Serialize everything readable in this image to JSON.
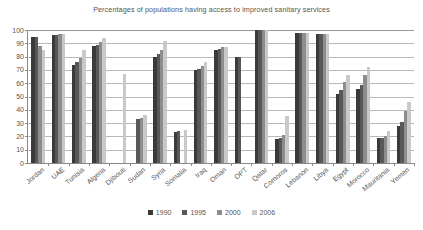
{
  "chart_data": {
    "type": "bar",
    "title": "Percentages of populations having access to improved sanitary services",
    "xlabel": "",
    "ylabel": "",
    "ylim": [
      0,
      100
    ],
    "yticks": [
      0,
      10,
      20,
      30,
      40,
      50,
      60,
      70,
      80,
      90,
      100
    ],
    "grid": true,
    "legend_position": "bottom",
    "categories": [
      "Jordan",
      "UAE",
      "Tunisia",
      "Algeria",
      "Djibouti",
      "Sudan",
      "Syria",
      "Somalia",
      "Iraq",
      "Oman",
      "OPT",
      "Qatar",
      "Comoros",
      "Lebanon",
      "Libya",
      "Egypt",
      "Morocco",
      "Mauritania",
      "Yemen"
    ],
    "series": [
      {
        "name": "1990",
        "color": "#3a3a3a",
        "values": [
          95,
          96,
          74,
          88,
          null,
          null,
          80,
          23,
          70,
          85,
          80,
          100,
          18,
          98,
          97,
          52,
          56,
          19,
          28
        ]
      },
      {
        "name": "1995",
        "color": "#585858",
        "values": [
          95,
          96,
          76,
          89,
          null,
          33,
          82,
          24,
          71,
          86,
          80,
          100,
          19,
          98,
          97,
          55,
          59,
          19,
          31
        ]
      },
      {
        "name": "2000",
        "color": "#8d8d8d",
        "values": [
          88,
          97,
          79,
          91,
          null,
          34,
          85,
          null,
          73,
          87,
          null,
          100,
          21,
          98,
          97,
          61,
          66,
          20,
          39
        ]
      },
      {
        "name": "2006",
        "color": "#c9c9c9",
        "values": [
          85,
          97,
          85,
          94,
          67,
          36,
          92,
          25,
          76,
          87,
          null,
          100,
          35,
          98,
          97,
          66,
          72,
          24,
          46
        ]
      }
    ]
  },
  "legend": {
    "items": [
      {
        "label": "1990",
        "color": "#3a3a3a"
      },
      {
        "label": "1995",
        "color": "#585858"
      },
      {
        "label": "2000",
        "color": "#8d8d8d"
      },
      {
        "label": "2006",
        "color": "#c9c9c9"
      }
    ]
  }
}
